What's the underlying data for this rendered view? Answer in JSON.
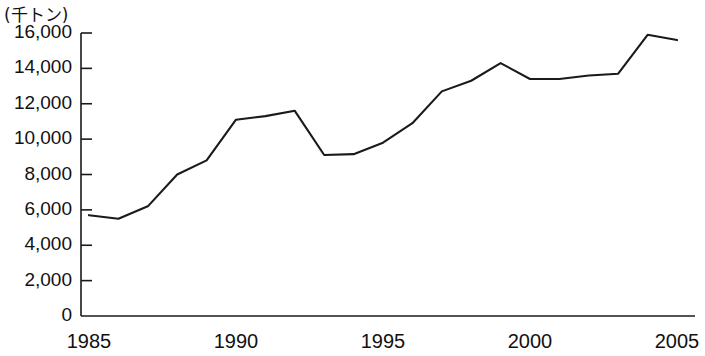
{
  "chart_data": {
    "type": "line",
    "title": "",
    "subtitle": "",
    "xlabel": "",
    "ylabel": "",
    "unit_label": "(千トン)",
    "grid": false,
    "legend": null,
    "xlim": [
      1985,
      2005
    ],
    "ylim": [
      0,
      16000
    ],
    "x_tick_labels": [
      "1985",
      "1990",
      "1995",
      "2000",
      "2005"
    ],
    "x_tick_values": [
      1985,
      1990,
      1995,
      2000,
      2005
    ],
    "y_tick_labels": [
      "0",
      "2,000",
      "4,000",
      "6,000",
      "8,000",
      "10,000",
      "12,000",
      "14,000",
      "16,000"
    ],
    "y_tick_values": [
      0,
      2000,
      4000,
      6000,
      8000,
      10000,
      12000,
      14000,
      16000
    ],
    "x": [
      1985,
      1986,
      1987,
      1988,
      1989,
      1990,
      1991,
      1992,
      1993,
      1994,
      1995,
      1996,
      1997,
      1998,
      1999,
      2000,
      2001,
      2002,
      2003,
      2004,
      2005
    ],
    "values": [
      5700,
      5500,
      6200,
      8000,
      8800,
      11100,
      11300,
      11600,
      9100,
      9150,
      9800,
      10900,
      12700,
      13300,
      14300,
      13400,
      13400,
      13600,
      13700,
      15900,
      15600
    ],
    "series": [
      {
        "name": "",
        "values": [
          5700,
          5500,
          6200,
          8000,
          8800,
          11100,
          11300,
          11600,
          9100,
          9150,
          9800,
          10900,
          12700,
          13300,
          14300,
          13400,
          13400,
          13600,
          13700,
          15900,
          15600
        ]
      }
    ],
    "line_color": "#1a1a1a",
    "axis_color": "#1a1a1a"
  }
}
